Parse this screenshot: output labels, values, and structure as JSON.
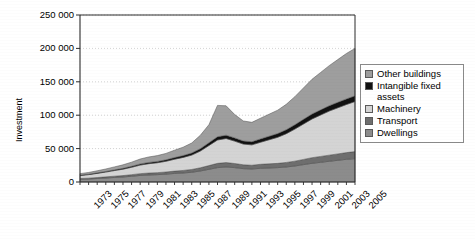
{
  "chart_data": {
    "type": "area",
    "stacked": true,
    "title": "",
    "subtitle": "",
    "xlabel": "",
    "ylabel": "Investment",
    "ylim": [
      0,
      250000
    ],
    "ytick_labels": [
      "250 000",
      "200 000",
      "150 000",
      "100 000",
      "50 000",
      "0"
    ],
    "ytick_values": [
      250000,
      200000,
      150000,
      100000,
      50000,
      0
    ],
    "grid": true,
    "legend_position": "right",
    "x": [
      1973,
      1974,
      1975,
      1976,
      1977,
      1978,
      1979,
      1980,
      1981,
      1982,
      1983,
      1984,
      1985,
      1986,
      1987,
      1988,
      1989,
      1990,
      1991,
      1992,
      1993,
      1994,
      1995,
      1996,
      1997,
      1998,
      1999,
      2000,
      2001,
      2002,
      2003,
      2004,
      2005
    ],
    "xtick_labels": [
      "1973",
      "1975",
      "1977",
      "1979",
      "1981",
      "1983",
      "1985",
      "1987",
      "1989",
      "1991",
      "1993",
      "1995",
      "1997",
      "1999",
      "2001",
      "2003",
      "2005"
    ],
    "xlim": [
      1973,
      2005
    ],
    "series": [
      {
        "name": "Dwellings",
        "color": "#8c8c8c",
        "stack_order": 1,
        "values": [
          4000,
          4500,
          5200,
          6000,
          6800,
          7500,
          8600,
          9800,
          10500,
          11000,
          11800,
          12800,
          13500,
          14600,
          16500,
          19000,
          21500,
          22500,
          21500,
          20000,
          19500,
          20500,
          21000,
          21500,
          22500,
          24000,
          26000,
          28000,
          29500,
          31000,
          32500,
          34000,
          35000
        ]
      },
      {
        "name": "Transport",
        "color": "#6e6e6e",
        "stack_order": 2,
        "values": [
          1200,
          1300,
          1500,
          1700,
          1900,
          2100,
          2400,
          2700,
          2900,
          3000,
          3200,
          3500,
          3800,
          4200,
          4800,
          5600,
          6400,
          6600,
          6200,
          5800,
          5600,
          6000,
          6200,
          6400,
          6800,
          7200,
          7800,
          8400,
          8800,
          9200,
          9600,
          10000,
          10500
        ]
      },
      {
        "name": "Machinery",
        "color": "#d4d4d4",
        "stack_order": 3,
        "values": [
          4500,
          5200,
          6200,
          7200,
          8400,
          9600,
          11000,
          12800,
          14000,
          14800,
          16000,
          17800,
          19500,
          21500,
          25000,
          30000,
          35000,
          36000,
          33500,
          31000,
          30500,
          33000,
          36000,
          39000,
          43000,
          48000,
          53000,
          58000,
          62000,
          66000,
          69000,
          72000,
          75000
        ]
      },
      {
        "name": "Intangible fixed assets",
        "color": "#111111",
        "stack_order": 4,
        "values": [
          600,
          700,
          800,
          900,
          1100,
          1300,
          1500,
          1700,
          1900,
          2000,
          2200,
          2500,
          2800,
          3100,
          3600,
          4200,
          4800,
          5000,
          4800,
          4600,
          4700,
          5000,
          5300,
          5600,
          6000,
          6500,
          7000,
          7400,
          7700,
          8000,
          8200,
          8400,
          8500
        ]
      },
      {
        "name": "Other buildings",
        "color": "#9e9e9e",
        "stack_order": 5,
        "values": [
          2200,
          2600,
          3100,
          3700,
          4400,
          5200,
          6200,
          7400,
          8200,
          8700,
          9600,
          11000,
          12500,
          15000,
          20000,
          27000,
          47000,
          44000,
          35000,
          30000,
          29000,
          31000,
          33000,
          35000,
          38000,
          42000,
          47000,
          52000,
          56000,
          60000,
          64000,
          68000,
          71000
        ]
      }
    ]
  },
  "legend": {
    "items": [
      {
        "label": "Other buildings",
        "color": "#9e9e9e"
      },
      {
        "label": "Intangible fixed assets",
        "color": "#111111"
      },
      {
        "label": "Machinery",
        "color": "#d4d4d4"
      },
      {
        "label": "Transport",
        "color": "#6e6e6e"
      },
      {
        "label": "Dwellings",
        "color": "#8c8c8c"
      }
    ]
  },
  "axes": {
    "y_title": "Investment"
  },
  "colors": {
    "axis": "#2b2b2b",
    "grid": "#c8c8c8",
    "background": "#ffffff"
  }
}
